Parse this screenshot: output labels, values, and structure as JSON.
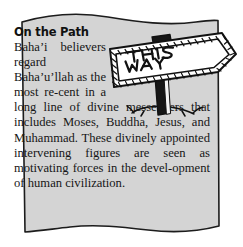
{
  "callout": {
    "heading": "On the Path",
    "body": "Baha’i believers regard Baha’u’llah as the most re-cent in a long line of divine messengers that includes Moses, Buddha, Jesus, and Muhammad. These divinely appointed intervening figures are seen as motivating forces in the devel-opment of human civilization.",
    "body_lines": [
      "Baha’i",
      "believers",
      "regard",
      "Baha’u’llah as",
      "the most re-",
      "cent in a long line of divine",
      "messengers that includes Moses,",
      "Buddha, Jesus, and Muhammad.",
      "These divinely appointed",
      "intervening figures are seen as",
      "motivating forces in the devel-",
      "opment of human civilization."
    ]
  },
  "illustration": {
    "name": "signpost-illustration",
    "sign_text_line1": "THIS",
    "sign_text_line2": "WAY",
    "description": "Hand drawn arrow signpost pointing right with hatched border, wooden post and grass tufts"
  },
  "colors": {
    "paper_fill": "#d4d4d4",
    "paper_outline": "#1c1c1c",
    "page_background": "#ffffff",
    "text": "#161616",
    "heading": "#111111",
    "sign_fill": "#ffffff",
    "sign_ink": "#111111",
    "post_fill": "#161616"
  }
}
